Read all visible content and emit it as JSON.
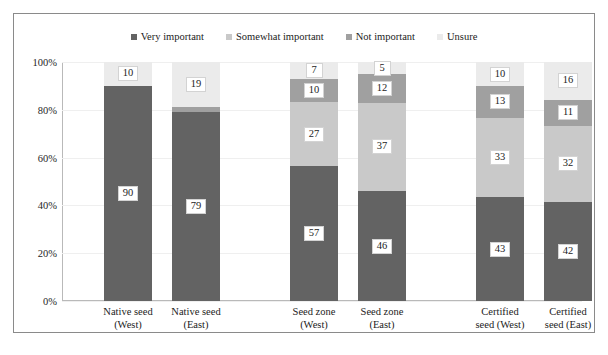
{
  "chart_data": {
    "type": "bar",
    "subtype": "stacked-bar-100-percent",
    "title": "",
    "subtitle": "",
    "xlabel": "",
    "ylabel": "",
    "ylim": [
      0,
      100
    ],
    "ytick_labels": [
      "0%",
      "20%",
      "40%",
      "60%",
      "80%",
      "100%"
    ],
    "ytick_values": [
      0,
      20,
      40,
      60,
      80,
      100
    ],
    "grid": true,
    "legend_position": "top-center",
    "categories": [
      "Native seed (West)",
      "Native seed (East)",
      "Seed zone (West)",
      "Seed zone (East)",
      "Certified seed (West)",
      "Certified seed (East)"
    ],
    "category_lines": [
      [
        "Native seed",
        "(West)"
      ],
      [
        "Native seed",
        "(East)"
      ],
      [
        "Seed zone",
        "(West)"
      ],
      [
        "Seed zone",
        "(East)"
      ],
      [
        "Certified",
        "seed (West)"
      ],
      [
        "Certified",
        "seed (East)"
      ]
    ],
    "series": [
      {
        "name": "Very important",
        "color": "#636363",
        "values": [
          90,
          79,
          57,
          46,
          43,
          42
        ]
      },
      {
        "name": "Somewhat important",
        "color": "#c9c9c9",
        "values": [
          0,
          0,
          27,
          37,
          33,
          32
        ]
      },
      {
        "name": "Not important",
        "color": "#a0a0a0",
        "values": [
          0,
          2,
          10,
          12,
          13,
          11
        ]
      },
      {
        "name": "Unsure",
        "color": "#ebebeb",
        "values": [
          10,
          19,
          7,
          5,
          10,
          16
        ]
      }
    ],
    "data_labels": {
      "Native seed (West)": {
        "Very important": "90",
        "Somewhat important": "",
        "Not important": "",
        "Unsure": "10"
      },
      "Native seed (East)": {
        "Very important": "79",
        "Somewhat important": "",
        "Not important": "",
        "Unsure": "19"
      },
      "Seed zone (West)": {
        "Very important": "57",
        "Somewhat important": "27",
        "Not important": "10",
        "Unsure": "7"
      },
      "Seed zone (East)": {
        "Very important": "46",
        "Somewhat important": "37",
        "Not important": "12",
        "Unsure": "5"
      },
      "Certified seed (West)": {
        "Very important": "43",
        "Somewhat important": "33",
        "Not important": "13",
        "Unsure": "10"
      },
      "Certified seed (East)": {
        "Very important": "42",
        "Somewhat important": "32",
        "Not important": "11",
        "Unsure": "16"
      }
    }
  },
  "legend": {
    "items": [
      {
        "label": "Very important",
        "color": "#636363"
      },
      {
        "label": "Somewhat important",
        "color": "#c9c9c9"
      },
      {
        "label": "Not important",
        "color": "#a0a0a0"
      },
      {
        "label": "Unsure",
        "color": "#ebebeb"
      }
    ]
  },
  "axes": {
    "y": {
      "ticks": [
        "100%",
        "80%",
        "60%",
        "40%",
        "20%",
        "0%"
      ]
    }
  }
}
